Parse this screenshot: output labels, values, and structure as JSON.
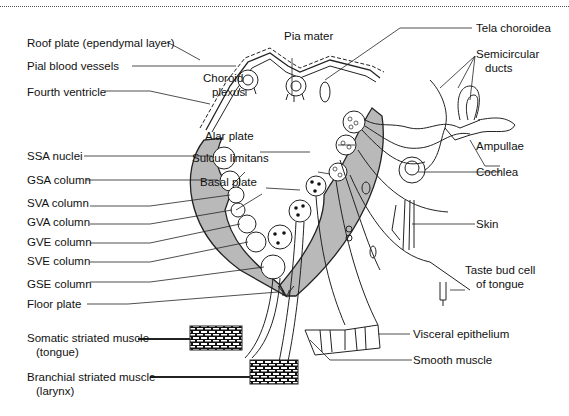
{
  "figure": {
    "colors": {
      "gray_matter": "#b9b9b9",
      "line": "#222222",
      "background": "#ffffff"
    },
    "labels_left": {
      "roof_plate": "Roof plate (ependymal layer)",
      "pial_blood_vessels": "Pial blood vessels",
      "fourth_ventricle": "Fourth ventricle",
      "ssa_nuclei": "SSA nuclei",
      "gsa_column": "GSA column",
      "sva_column": "SVA column",
      "gva_column": "GVA column",
      "gve_column": "GVE column",
      "sve_column": "SVE column",
      "gse_column": "GSE column",
      "floor_plate": "Floor plate",
      "somatic_muscle": "Somatic striated muscle",
      "somatic_muscle_sub": "(tongue)",
      "branchial_muscle": "Branchial striated muscle",
      "branchial_muscle_sub": "(larynx)"
    },
    "labels_center": {
      "pia_mater": "Pia mater",
      "choroid_plexus_1": "Choroid",
      "choroid_plexus_2": "plexus",
      "alar_plate": "Alar plate",
      "sulcus_limitans": "Sulcus limitans",
      "basal_plate": "Basal plate"
    },
    "labels_right": {
      "tela_choroidea": "Tela choroidea",
      "semicircular_ducts_1": "Semicircular",
      "semicircular_ducts_2": "ducts",
      "ampullae": "Ampullae",
      "cochlea": "Cochlea",
      "skin": "Skin",
      "taste_bud_1": "Taste bud cell",
      "taste_bud_2": "of tongue",
      "visceral_epithelium": "Visceral epithelium",
      "smooth_muscle": "Smooth muscle"
    }
  }
}
